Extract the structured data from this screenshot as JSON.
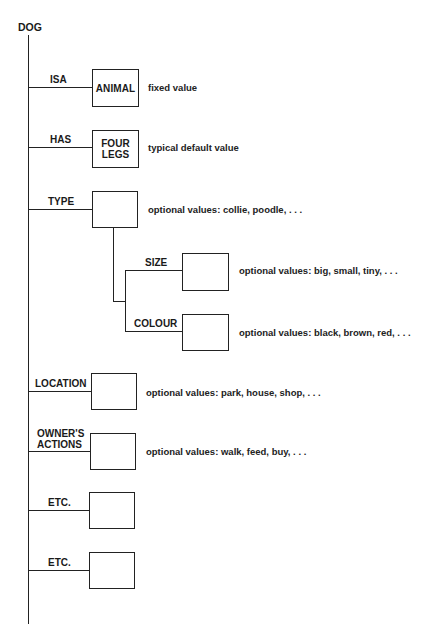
{
  "diagram": {
    "root": "DOG",
    "slots": [
      {
        "label": "ISA",
        "value": "ANIMAL",
        "note": "fixed value"
      },
      {
        "label": "HAS",
        "value": "FOUR\nLEGS",
        "note": "typical default value"
      },
      {
        "label": "TYPE",
        "value": "",
        "note": "optional values: collie, poodle, . . .",
        "subslots": [
          {
            "label": "SIZE",
            "value": "",
            "note": "optional values: big, small, tiny, . . ."
          },
          {
            "label": "COLOUR",
            "value": "",
            "note": "optional values: black, brown, red, . . ."
          }
        ]
      },
      {
        "label": "LOCATION",
        "value": "",
        "note": "optional values: park, house, shop, . . ."
      },
      {
        "label": "OWNER'S\nACTIONS",
        "value": "",
        "note": "optional values: walk, feed, buy, . . ."
      },
      {
        "label": "ETC.",
        "value": "",
        "note": ""
      },
      {
        "label": "ETC.",
        "value": "",
        "note": ""
      }
    ]
  },
  "colors": {
    "line": "#222222",
    "background": "#ffffff",
    "text": "#1a1a1a"
  }
}
